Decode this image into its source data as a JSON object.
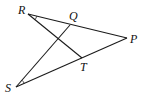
{
  "figure": {
    "type": "geometry-diagram",
    "points": [
      {
        "name": "R",
        "label": "R",
        "x": 28,
        "y": 14,
        "lx": 18,
        "ly": 14
      },
      {
        "name": "Q",
        "label": "Q",
        "x": 70,
        "y": 25,
        "lx": 69,
        "ly": 20
      },
      {
        "name": "P",
        "label": "P",
        "x": 127,
        "y": 38,
        "lx": 130,
        "ly": 43
      },
      {
        "name": "T",
        "label": "T",
        "x": 82,
        "y": 58,
        "lx": 80,
        "ly": 71
      },
      {
        "name": "S",
        "label": "S",
        "x": 16,
        "y": 87,
        "lx": 5,
        "ly": 92
      }
    ],
    "segments": [
      {
        "from": "R",
        "to": "P"
      },
      {
        "from": "S",
        "to": "P"
      },
      {
        "from": "R",
        "to": "T"
      },
      {
        "from": "S",
        "to": "Q"
      }
    ],
    "angle_marks": [
      {
        "vertex": "R",
        "between": [
          "Q",
          "T"
        ]
      },
      {
        "vertex": "S",
        "between": [
          "Q",
          "T"
        ]
      }
    ]
  }
}
